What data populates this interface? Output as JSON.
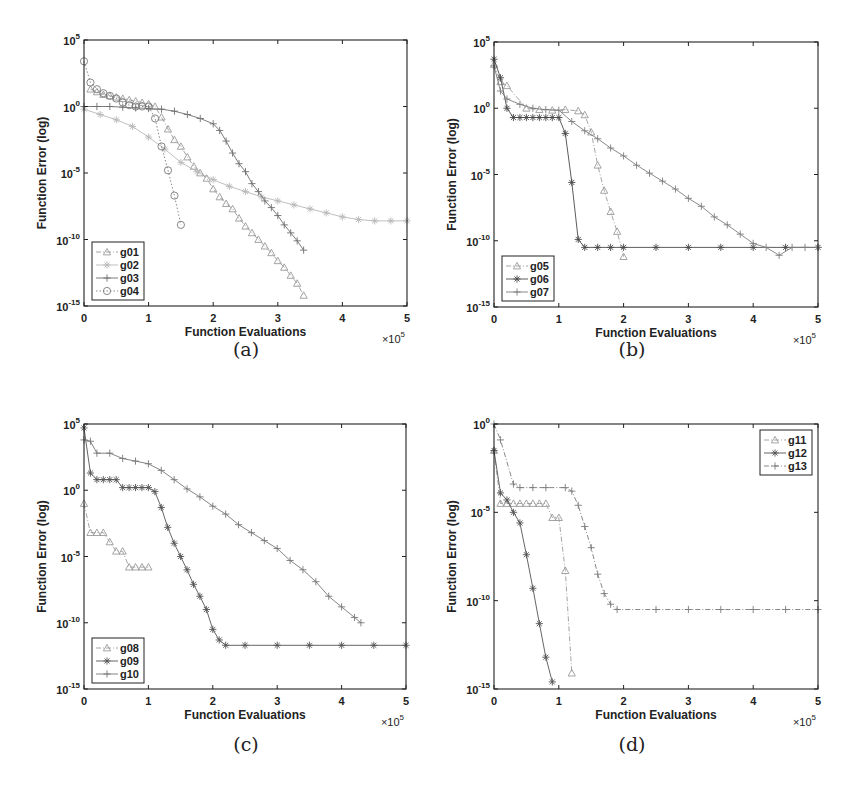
{
  "figure": {
    "captions": [
      "(a)",
      "(b)",
      "(c)",
      "(d)"
    ],
    "xlabel": "Function Evaluations",
    "ylabel": "Function Error (log)",
    "x_multiplier": "×10",
    "x_multiplier_exp": "5"
  },
  "chart_data": [
    {
      "type": "line",
      "panel": "(a)",
      "xlabel": "Function Evaluations",
      "ylabel": "Function Error (log)",
      "x_scale_note": "x values in units of 10^5",
      "yscale": "log",
      "xlim": [
        0,
        5
      ],
      "ylim_log10": [
        -15,
        5
      ],
      "xticks": [
        0,
        1,
        2,
        3,
        4,
        5
      ],
      "yticks_log10": [
        5,
        0,
        -5,
        -10,
        -15
      ],
      "legend_position": "lower left",
      "series": [
        {
          "name": "g01",
          "marker": "triangle",
          "line": "dashdot",
          "color": "#9a9a9a",
          "x": [
            0.1,
            0.2,
            0.3,
            0.4,
            0.5,
            0.6,
            0.7,
            0.8,
            0.9,
            1.0,
            1.1,
            1.2,
            1.3,
            1.4,
            1.5,
            1.6,
            1.7,
            1.8,
            1.9,
            2.0,
            2.1,
            2.2,
            2.3,
            2.4,
            2.5,
            2.6,
            2.7,
            2.8,
            2.9,
            3.0,
            3.1,
            3.2,
            3.3,
            3.4
          ],
          "log10_y": [
            1.3,
            1.1,
            0.9,
            0.8,
            0.7,
            0.6,
            0.5,
            0.4,
            0.3,
            0.2,
            0.0,
            -0.8,
            -1.7,
            -2.5,
            -3.0,
            -3.8,
            -4.5,
            -5.0,
            -5.4,
            -6.2,
            -6.8,
            -7.3,
            -7.7,
            -8.4,
            -9.0,
            -9.5,
            -10.0,
            -10.5,
            -11.0,
            -11.6,
            -12.1,
            -12.7,
            -13.3,
            -14.2
          ]
        },
        {
          "name": "g02",
          "marker": "star",
          "line": "solid",
          "color": "#b8b8b8",
          "x": [
            0,
            0.25,
            0.5,
            0.75,
            1.0,
            1.25,
            1.5,
            1.75,
            2.0,
            2.25,
            2.5,
            2.75,
            3.0,
            3.25,
            3.5,
            3.75,
            4.0,
            4.25,
            4.5,
            4.75,
            5.0
          ],
          "log10_y": [
            -0.2,
            -0.6,
            -1.0,
            -1.5,
            -2.3,
            -3.2,
            -4.2,
            -4.9,
            -5.5,
            -6.0,
            -6.4,
            -6.8,
            -7.1,
            -7.4,
            -7.7,
            -8.0,
            -8.3,
            -8.5,
            -8.6,
            -8.6,
            -8.6
          ]
        },
        {
          "name": "g03",
          "marker": "plus",
          "line": "solid",
          "color": "#6e6e6e",
          "x": [
            0,
            0.2,
            0.4,
            0.6,
            0.8,
            1.0,
            1.2,
            1.4,
            1.6,
            1.8,
            2.0,
            2.1,
            2.2,
            2.3,
            2.4,
            2.5,
            2.6,
            2.7,
            2.8,
            2.9,
            3.0,
            3.1,
            3.2,
            3.3,
            3.4
          ],
          "log10_y": [
            0.0,
            0.0,
            0.0,
            -0.05,
            -0.1,
            -0.15,
            -0.2,
            -0.35,
            -0.6,
            -0.9,
            -1.3,
            -1.8,
            -2.6,
            -3.5,
            -4.3,
            -4.9,
            -5.8,
            -6.4,
            -7.1,
            -7.6,
            -8.2,
            -8.9,
            -9.5,
            -10.1,
            -10.8
          ]
        },
        {
          "name": "g04",
          "marker": "circle",
          "line": "dotted",
          "color": "#7a7a7a",
          "x": [
            0,
            0.1,
            0.2,
            0.3,
            0.4,
            0.5,
            0.6,
            0.7,
            0.8,
            0.9,
            1.0,
            1.1,
            1.2,
            1.3,
            1.4,
            1.5
          ],
          "log10_y": [
            3.4,
            1.8,
            1.3,
            1.0,
            0.8,
            0.6,
            0.3,
            0.1,
            0.0,
            0.0,
            0.0,
            -0.9,
            -3.0,
            -4.8,
            -6.7,
            -8.9
          ]
        }
      ]
    },
    {
      "type": "line",
      "panel": "(b)",
      "xlabel": "Function Evaluations",
      "ylabel": "Function Error (log)",
      "x_scale_note": "x values in units of 10^5",
      "yscale": "log",
      "xlim": [
        0,
        5
      ],
      "ylim_log10": [
        -15,
        5
      ],
      "xticks": [
        0,
        1,
        2,
        3,
        4,
        5
      ],
      "yticks_log10": [
        5,
        0,
        -5,
        -10,
        -15
      ],
      "legend_position": "lower left",
      "series": [
        {
          "name": "g05",
          "marker": "triangle",
          "line": "dashdot",
          "color": "#9a9a9a",
          "x": [
            0,
            0.1,
            0.2,
            0.5,
            0.7,
            0.9,
            1.1,
            1.3,
            1.4,
            1.5,
            1.6,
            1.7,
            1.8,
            1.9,
            2.0
          ],
          "log10_y": [
            3.3,
            2.0,
            1.7,
            0.0,
            -0.1,
            -0.15,
            -0.1,
            -0.2,
            -0.5,
            -1.8,
            -4.3,
            -6.2,
            -7.8,
            -9.3,
            -11.2
          ]
        },
        {
          "name": "g06",
          "marker": "star",
          "line": "solid",
          "color": "#4a4a4a",
          "x": [
            0,
            0.1,
            0.2,
            0.3,
            0.4,
            0.5,
            0.6,
            0.7,
            0.8,
            0.9,
            1.0,
            1.1,
            1.2,
            1.3,
            1.4,
            1.6,
            1.8,
            2.0,
            2.5,
            3.0,
            3.5,
            4.0,
            4.5,
            5.0
          ],
          "log10_y": [
            3.7,
            2.3,
            0.0,
            -0.7,
            -0.7,
            -0.7,
            -0.7,
            -0.7,
            -0.7,
            -0.7,
            -0.7,
            -1.9,
            -5.6,
            -9.9,
            -10.5,
            -10.5,
            -10.5,
            -10.5,
            -10.5,
            -10.5,
            -10.5,
            -10.5,
            -10.5,
            -10.5
          ]
        },
        {
          "name": "g07",
          "marker": "plus",
          "line": "solid",
          "color": "#7e7e7e",
          "x": [
            0,
            0.1,
            0.2,
            0.4,
            0.6,
            0.8,
            1.0,
            1.2,
            1.4,
            1.6,
            1.8,
            2.0,
            2.2,
            2.4,
            2.6,
            2.8,
            3.0,
            3.2,
            3.4,
            3.6,
            3.8,
            4.0,
            4.2,
            4.4,
            4.6,
            4.8,
            5.0
          ],
          "log10_y": [
            3.2,
            1.3,
            0.7,
            0.3,
            0.0,
            -0.1,
            -0.15,
            -1.0,
            -1.7,
            -2.3,
            -3.0,
            -3.6,
            -4.3,
            -4.9,
            -5.5,
            -6.1,
            -6.8,
            -7.4,
            -8.2,
            -8.8,
            -9.5,
            -10.2,
            -10.5,
            -11.1,
            -10.5,
            -10.5,
            -10.5
          ]
        }
      ]
    },
    {
      "type": "line",
      "panel": "(c)",
      "xlabel": "Function Evaluations",
      "ylabel": "Function Error (log)",
      "x_scale_note": "x values in units of 10^5",
      "yscale": "log",
      "xlim": [
        0,
        5
      ],
      "ylim_log10": [
        -15,
        5
      ],
      "xticks": [
        0,
        1,
        2,
        3,
        4,
        5
      ],
      "yticks_log10": [
        5,
        0,
        -5,
        -10,
        -15
      ],
      "legend_position": "lower left",
      "series": [
        {
          "name": "g08",
          "marker": "triangle",
          "line": "dashdot",
          "color": "#9a9a9a",
          "x": [
            0,
            0.1,
            0.2,
            0.3,
            0.4,
            0.5,
            0.6,
            0.7,
            0.8,
            0.9,
            1.0
          ],
          "log10_y": [
            -1.0,
            -3.2,
            -3.2,
            -3.2,
            -3.9,
            -4.6,
            -4.6,
            -5.8,
            -5.8,
            -5.8,
            -5.8
          ]
        },
        {
          "name": "g09",
          "marker": "star",
          "line": "solid",
          "color": "#555555",
          "x": [
            0,
            0.1,
            0.2,
            0.3,
            0.4,
            0.5,
            0.6,
            0.7,
            0.8,
            0.9,
            1.0,
            1.1,
            1.2,
            1.3,
            1.4,
            1.5,
            1.6,
            1.7,
            1.8,
            1.9,
            2.0,
            2.1,
            2.2,
            2.5,
            3.0,
            3.5,
            4.0,
            4.5,
            5.0
          ],
          "log10_y": [
            4.7,
            1.3,
            0.8,
            0.8,
            0.8,
            0.8,
            0.2,
            0.2,
            0.2,
            0.2,
            0.2,
            -0.1,
            -1.3,
            -2.8,
            -4.0,
            -5.0,
            -6.0,
            -7.1,
            -8.0,
            -9.0,
            -10.5,
            -11.3,
            -11.7,
            -11.7,
            -11.7,
            -11.7,
            -11.7,
            -11.7,
            -11.7
          ]
        },
        {
          "name": "g10",
          "marker": "plus",
          "line": "solid",
          "color": "#777777",
          "x": [
            0,
            0.1,
            0.2,
            0.4,
            0.6,
            0.8,
            1.0,
            1.2,
            1.4,
            1.6,
            1.8,
            2.0,
            2.2,
            2.4,
            2.6,
            2.8,
            3.0,
            3.2,
            3.4,
            3.6,
            3.8,
            4.0,
            4.2,
            4.3
          ],
          "log10_y": [
            3.8,
            3.7,
            2.8,
            2.8,
            2.4,
            2.2,
            2.0,
            1.5,
            0.8,
            0.1,
            -0.5,
            -1.2,
            -1.8,
            -2.6,
            -3.2,
            -3.8,
            -4.4,
            -5.3,
            -6.0,
            -6.9,
            -8.0,
            -8.8,
            -9.6,
            -10.0
          ]
        }
      ]
    },
    {
      "type": "line",
      "panel": "(d)",
      "xlabel": "Function Evaluations",
      "ylabel": "Function Error (log)",
      "x_scale_note": "x values in units of 10^5",
      "yscale": "log",
      "xlim": [
        0,
        5
      ],
      "ylim_log10": [
        -15,
        0
      ],
      "xticks": [
        0,
        1,
        2,
        3,
        4,
        5
      ],
      "yticks_log10": [
        0,
        -5,
        -10,
        -15
      ],
      "legend_position": "upper right",
      "series": [
        {
          "name": "g11",
          "marker": "triangle",
          "line": "dashdot",
          "color": "#9a9a9a",
          "x": [
            0,
            0.1,
            0.2,
            0.3,
            0.4,
            0.5,
            0.6,
            0.7,
            0.8,
            0.9,
            1.0,
            1.1,
            1.2
          ],
          "log10_y": [
            -1.5,
            -4.5,
            -4.5,
            -4.5,
            -4.5,
            -4.5,
            -4.5,
            -4.5,
            -4.5,
            -5.3,
            -5.3,
            -8.3,
            -14.1
          ]
        },
        {
          "name": "g12",
          "marker": "star",
          "line": "solid",
          "color": "#555555",
          "x": [
            0,
            0.1,
            0.2,
            0.3,
            0.4,
            0.5,
            0.6,
            0.7,
            0.8,
            0.9
          ],
          "log10_y": [
            -1.5,
            -3.9,
            -4.3,
            -5.0,
            -5.6,
            -7.4,
            -9.3,
            -11.3,
            -13.2,
            -14.6
          ]
        },
        {
          "name": "g13",
          "marker": "plus",
          "line": "dashdot",
          "color": "#7a7a7a",
          "x": [
            0,
            0.1,
            0.3,
            0.4,
            0.6,
            0.8,
            1.1,
            1.2,
            1.3,
            1.4,
            1.5,
            1.6,
            1.7,
            1.8,
            1.9,
            2.5,
            3.0,
            3.5,
            4.0,
            4.5,
            5.0
          ],
          "log10_y": [
            0.0,
            -0.9,
            -3.4,
            -3.6,
            -3.6,
            -3.6,
            -3.6,
            -3.8,
            -4.6,
            -5.8,
            -7.0,
            -8.5,
            -9.6,
            -10.2,
            -10.5,
            -10.5,
            -10.5,
            -10.5,
            -10.5,
            -10.5,
            -10.5
          ]
        }
      ]
    }
  ]
}
